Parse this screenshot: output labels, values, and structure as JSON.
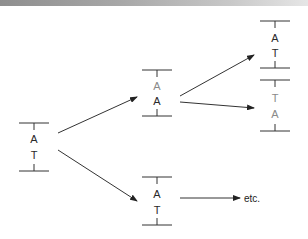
{
  "colors": {
    "ink": "#2a2a2a",
    "faded": "#8a8a8a",
    "line": "#333333"
  },
  "structures": [
    {
      "id": "parent",
      "cx": 34,
      "top": 123,
      "bottom": 171,
      "bases": [
        {
          "label": "A",
          "y": 143,
          "faded": false
        },
        {
          "label": "T",
          "y": 159,
          "faded": false
        }
      ]
    },
    {
      "id": "daughter-1",
      "cx": 157,
      "top": 70,
      "bottom": 116,
      "bases": [
        {
          "label": "A",
          "y": 90,
          "faded": true
        },
        {
          "label": "A",
          "y": 105,
          "faded": false
        }
      ]
    },
    {
      "id": "daughter-2",
      "cx": 157,
      "top": 177,
      "bottom": 225,
      "bases": [
        {
          "label": "A",
          "y": 198,
          "faded": false
        },
        {
          "label": "T",
          "y": 214,
          "faded": false
        }
      ]
    },
    {
      "id": "granddaughter-1",
      "cx": 275,
      "top": 21,
      "bottom": 68,
      "bases": [
        {
          "label": "A",
          "y": 42,
          "faded": false
        },
        {
          "label": "T",
          "y": 57,
          "faded": false
        }
      ]
    },
    {
      "id": "granddaughter-2",
      "cx": 275,
      "top": 80,
      "bottom": 131,
      "bases": [
        {
          "label": "T",
          "y": 102,
          "faded": true
        },
        {
          "label": "A",
          "y": 118,
          "faded": true
        }
      ]
    }
  ],
  "arrows": [
    {
      "from": [
        58,
        133
      ],
      "to": [
        137,
        97
      ]
    },
    {
      "from": [
        58,
        150
      ],
      "to": [
        137,
        201
      ]
    },
    {
      "from": [
        180,
        96
      ],
      "to": [
        254,
        55
      ]
    },
    {
      "from": [
        180,
        102
      ],
      "to": [
        254,
        108
      ]
    },
    {
      "from": [
        180,
        198
      ],
      "to": [
        240,
        198
      ]
    }
  ],
  "labels": {
    "etc": "etc."
  }
}
